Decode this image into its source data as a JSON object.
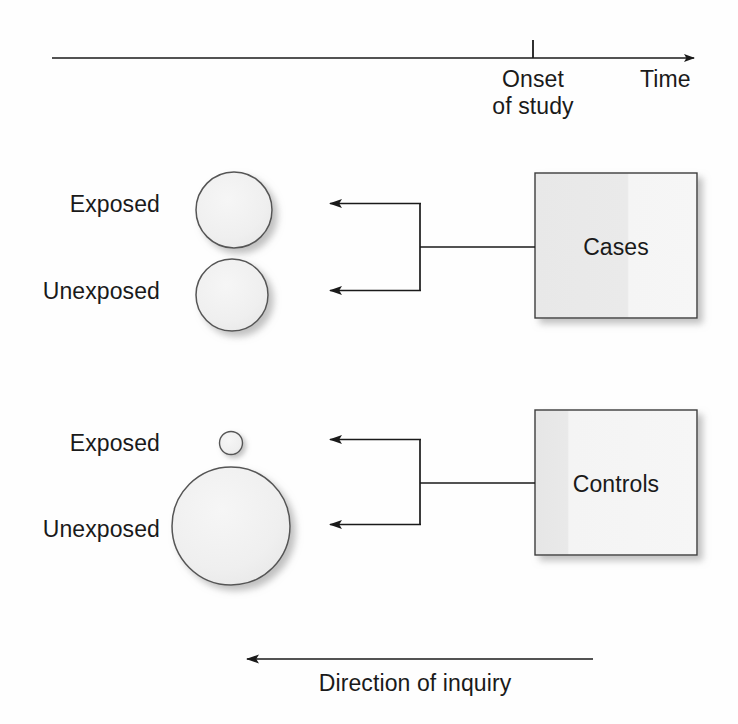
{
  "figure": {
    "type": "case-control-study-schematic",
    "timeline": {
      "tick_label_line1": "Onset",
      "tick_label_line2": "of study",
      "axis_label": "Time",
      "tick_x": 533,
      "axis_y": 58,
      "axis_start_x": 52,
      "axis_end_x": 700
    },
    "groups": [
      {
        "id": "cases",
        "box_label": "Cases",
        "box": {
          "x": 535,
          "y": 173,
          "w": 162,
          "h": 145
        },
        "bracket": {
          "stem_y": 247,
          "vertical_x": 420,
          "arrow_tip_x": 320,
          "top_y": 204,
          "bottom_y": 290
        },
        "strata": [
          {
            "label": "Exposed",
            "cx": 234,
            "cy": 210,
            "r": 38
          },
          {
            "label": "Unexposed",
            "cx": 232,
            "cy": 295,
            "r": 36
          }
        ]
      },
      {
        "id": "controls",
        "box_label": "Controls",
        "box": {
          "x": 535,
          "y": 410,
          "w": 162,
          "h": 145
        },
        "bracket": {
          "stem_y": 483,
          "vertical_x": 420,
          "arrow_tip_x": 320,
          "top_y": 440,
          "bottom_y": 524
        },
        "strata": [
          {
            "label": "Exposed",
            "cx": 231,
            "cy": 443,
            "r": 11.5
          },
          {
            "label": "Unexposed",
            "cx": 231,
            "cy": 526,
            "r": 59
          }
        ]
      }
    ],
    "inquiry": {
      "label": "Direction of inquiry",
      "arrow_y": 659,
      "arrow_start_x": 593,
      "arrow_tip_x": 236
    },
    "colors": {
      "stroke": "#1a1a1a",
      "circle_fill": "#efefef",
      "circle_stroke": "#555555",
      "box_fill_dark": "#e9e9e9",
      "box_fill_light": "#f4f4f4",
      "box_stroke": "#3c3c3c",
      "shadow": "#b9b9b9",
      "background": "#fefefe",
      "text": "#1a1a1a"
    }
  }
}
